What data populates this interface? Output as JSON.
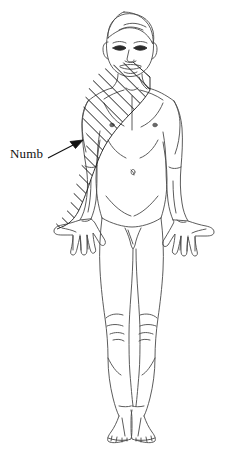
{
  "illustration": {
    "title": "Anterior full-body human figure with shaded sensory region",
    "view": "anterior",
    "subject": "adult male standing figure, arms at sides, palms forward",
    "background_color": "#ffffff",
    "outline_color": "#4a4a4a",
    "hatch_color": "#1a1a1a",
    "label_color": "#111111"
  },
  "annotations": [
    {
      "label": "Numb",
      "label_x": 10,
      "label_y": 146,
      "arrow_from_x": 48,
      "arrow_from_y": 158,
      "arrow_to_x": 83,
      "arrow_to_y": 140,
      "points_to": "left shoulder and arm shaded region"
    }
  ],
  "shaded_regions": [
    {
      "name": "numb-region",
      "pattern": "diagonal-hatching",
      "hatch_angle_degrees": 45,
      "hatch_spacing_px": 6,
      "body_parts": [
        "left clavicle",
        "left shoulder",
        "left upper chest",
        "left upper arm",
        "left forearm",
        "left hand"
      ],
      "side": "anatomical left (viewer left)"
    }
  ],
  "body_features": {
    "head": [
      "hair",
      "ears",
      "eyebrows",
      "eyes",
      "nose",
      "mouth",
      "chin"
    ],
    "torso": [
      "neck",
      "clavicles",
      "nipples",
      "navel",
      "abdomen contour"
    ],
    "limbs": [
      "left arm",
      "right arm",
      "left hand",
      "right hand",
      "left leg",
      "right leg",
      "knees",
      "left foot",
      "right foot"
    ]
  }
}
